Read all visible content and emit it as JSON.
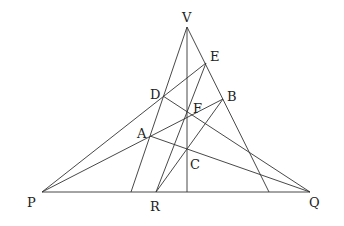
{
  "diagram": {
    "type": "projective-geometry-figure",
    "points": {
      "V": {
        "label": "V",
        "x": 187,
        "y": 27,
        "lx": 182,
        "ly": 22
      },
      "E": {
        "label": "E",
        "x": 206,
        "y": 63,
        "lx": 210,
        "ly": 61
      },
      "D": {
        "label": "D",
        "x": 163,
        "y": 96,
        "lx": 150,
        "ly": 99
      },
      "B": {
        "label": "B",
        "x": 223,
        "y": 99,
        "lx": 227,
        "ly": 101
      },
      "F": {
        "label": "F",
        "x": 187,
        "y": 116,
        "lx": 193,
        "ly": 113
      },
      "A": {
        "label": "A",
        "x": 150,
        "y": 136,
        "lx": 137,
        "ly": 138
      },
      "C": {
        "label": "C",
        "x": 187,
        "y": 149,
        "lx": 190,
        "ly": 169
      },
      "P": {
        "label": "P",
        "x": 42,
        "y": 192,
        "lx": 27,
        "ly": 207
      },
      "R": {
        "label": "R",
        "x": 156,
        "y": 192,
        "lx": 150,
        "ly": 211
      },
      "Q": {
        "label": "Q",
        "x": 310,
        "y": 192,
        "lx": 309,
        "ly": 207
      }
    },
    "segments": [
      {
        "name": "base-line-PQ",
        "x1": 42,
        "y1": 192,
        "x2": 310,
        "y2": 192
      },
      {
        "name": "left-side-V-foot",
        "x1": 187,
        "y1": 27,
        "x2": 131,
        "y2": 192
      },
      {
        "name": "right-side-V-foot",
        "x1": 187,
        "y1": 27,
        "x2": 269,
        "y2": 192
      },
      {
        "name": "vertical-V-base",
        "x1": 187,
        "y1": 27,
        "x2": 187,
        "y2": 192
      },
      {
        "name": "line-PE",
        "x1": 42,
        "y1": 192,
        "x2": 206,
        "y2": 63
      },
      {
        "name": "line-PB",
        "x1": 42,
        "y1": 192,
        "x2": 223,
        "y2": 99
      },
      {
        "name": "line-AQ",
        "x1": 150,
        "y1": 136,
        "x2": 310,
        "y2": 192
      },
      {
        "name": "line-DQ",
        "x1": 163,
        "y1": 96,
        "x2": 310,
        "y2": 192
      },
      {
        "name": "line-RE",
        "x1": 156,
        "y1": 192,
        "x2": 206,
        "y2": 63
      },
      {
        "name": "line-RB",
        "x1": 156,
        "y1": 192,
        "x2": 223,
        "y2": 99
      }
    ]
  }
}
